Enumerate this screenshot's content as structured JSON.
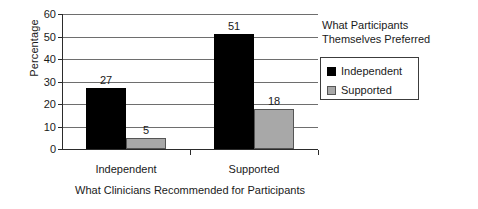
{
  "chart_data": {
    "type": "bar",
    "title": "",
    "xlabel": "What Clinicians Recommended for Participants",
    "ylabel": "Percentage",
    "categories": [
      "Independent",
      "Supported"
    ],
    "series": [
      {
        "name": "Independent",
        "color": "#000000",
        "values": [
          27,
          51
        ]
      },
      {
        "name": "Supported",
        "color": "#a8a8a8",
        "values": [
          5,
          18
        ]
      }
    ],
    "ylim": [
      0,
      60
    ],
    "ytick_labels": [
      "0",
      "10",
      "20",
      "30",
      "40",
      "50",
      "60"
    ],
    "ytick_values": [
      0,
      10,
      20,
      30,
      40,
      50,
      60
    ],
    "grid": "horizontal",
    "legend_position": "right",
    "legend_title": "What Participants Themselves Preferred",
    "data_labels": [
      "27",
      "5",
      "51",
      "18"
    ]
  },
  "legend": {
    "title_line_1": "What Participants",
    "title_line_2": "Themselves Preferred",
    "entries": [
      {
        "label": "Independent"
      },
      {
        "label": "Supported"
      }
    ]
  }
}
